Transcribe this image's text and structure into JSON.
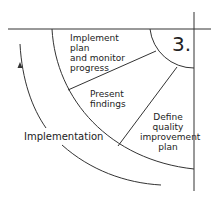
{
  "diagram": {
    "step_number": "3.",
    "segments": [
      {
        "label": "Implement plan and monitor progress",
        "lines": [
          "Implement plan",
          "and monitor",
          "progress"
        ]
      },
      {
        "label": "Present findings",
        "lines": [
          "Present",
          "findings"
        ]
      },
      {
        "label": "Define quality improvement plan",
        "lines": [
          "Define",
          "quality",
          "improvement",
          "plan"
        ]
      }
    ],
    "phase_label": "Implementation",
    "stroke_color": "#333333"
  }
}
